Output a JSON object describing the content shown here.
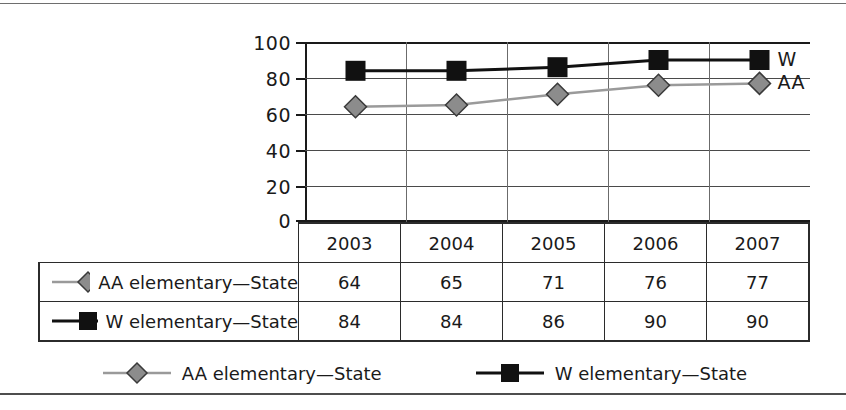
{
  "chart_data": {
    "type": "line",
    "title": "",
    "xlabel": "",
    "ylabel": "",
    "categories": [
      "2003",
      "2004",
      "2005",
      "2006",
      "2007"
    ],
    "ylim": [
      0,
      100
    ],
    "yticks": [
      0,
      20,
      40,
      60,
      80,
      100
    ],
    "grid": true,
    "legend_position": "bottom",
    "series": [
      {
        "name": "AA elementary—State",
        "short_label": "AA",
        "values": [
          64,
          65,
          71,
          76,
          77
        ],
        "color": "#9a9a9a",
        "marker": "diamond",
        "marker_fill": "#8c8c8c"
      },
      {
        "name": "W elementary—State",
        "short_label": "W",
        "values": [
          84,
          84,
          86,
          90,
          90
        ],
        "color": "#111111",
        "marker": "square",
        "marker_fill": "#111111"
      }
    ],
    "annotations": [
      {
        "text": "W",
        "series": "W elementary—State"
      },
      {
        "text": "AA",
        "series": "AA elementary—State"
      }
    ]
  },
  "axis": {
    "y_tick_labels": [
      "100",
      "80",
      "60",
      "40",
      "20",
      "0"
    ]
  },
  "table": {
    "year_headers": [
      "2003",
      "2004",
      "2005",
      "2006",
      "2007"
    ],
    "rows": [
      {
        "label": "AA elementary—State",
        "values": [
          "64",
          "65",
          "71",
          "76",
          "77"
        ]
      },
      {
        "label": "W elementary—State",
        "values": [
          "84",
          "84",
          "86",
          "90",
          "90"
        ]
      }
    ]
  },
  "legend": {
    "items": [
      {
        "label": "AA elementary—State"
      },
      {
        "label": "W elementary—State"
      }
    ]
  }
}
